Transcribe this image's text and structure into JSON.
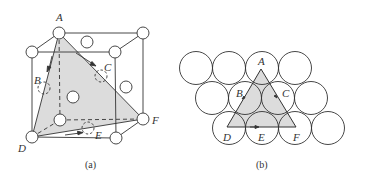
{
  "panel_a": {
    "caption": "(a)",
    "labels": {
      "A": "A",
      "B": "B",
      "C": "C",
      "D": "D",
      "E": "E",
      "F": "F"
    }
  },
  "panel_b": {
    "caption": "(b)",
    "labels": {
      "A": "A",
      "B": "B",
      "C": "C",
      "D": "D",
      "E": "E",
      "F": "F"
    }
  },
  "colors": {
    "line": "#333333",
    "shade": "#d9d9d9",
    "background": "#ffffff"
  }
}
